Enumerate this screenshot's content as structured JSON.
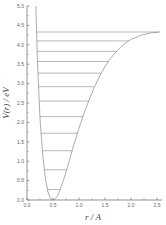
{
  "chart_data": {
    "type": "line",
    "title": "",
    "xlabel": "r / A",
    "ylabel": "V(r) / eV",
    "xlim": [
      0.0,
      2.6
    ],
    "ylim": [
      0.0,
      5.0
    ],
    "grid": false,
    "legend": null,
    "x_ticks": [
      "0.0",
      "0.5",
      "1.0",
      "1.5",
      "2.0",
      "2.5"
    ],
    "y_ticks": [
      "0.0",
      "0.5",
      "1.0",
      "1.5",
      "2.0",
      "2.5",
      "3.0",
      "3.5",
      "4.0",
      "4.5",
      "5.0"
    ],
    "potential_curve": {
      "name": "Morse potential V(r)",
      "description": "Asymmetric potential well with minimum near r = 0.5 A, V = 0; steep repulsive wall at small r, dissociation toward ~4.35 eV at large r",
      "points": [
        {
          "r": 0.17,
          "V": 5.0
        },
        {
          "r": 0.2,
          "V": 3.6
        },
        {
          "r": 0.25,
          "V": 2.1
        },
        {
          "r": 0.3,
          "V": 1.2
        },
        {
          "r": 0.35,
          "V": 0.6
        },
        {
          "r": 0.4,
          "V": 0.22
        },
        {
          "r": 0.45,
          "V": 0.04
        },
        {
          "r": 0.5,
          "V": 0.0
        },
        {
          "r": 0.55,
          "V": 0.04
        },
        {
          "r": 0.6,
          "V": 0.14
        },
        {
          "r": 0.7,
          "V": 0.5
        },
        {
          "r": 0.8,
          "V": 0.95
        },
        {
          "r": 0.9,
          "V": 1.42
        },
        {
          "r": 1.0,
          "V": 1.85
        },
        {
          "r": 1.1,
          "V": 2.25
        },
        {
          "r": 1.2,
          "V": 2.6
        },
        {
          "r": 1.3,
          "V": 2.92
        },
        {
          "r": 1.4,
          "V": 3.2
        },
        {
          "r": 1.5,
          "V": 3.44
        },
        {
          "r": 1.6,
          "V": 3.64
        },
        {
          "r": 1.7,
          "V": 3.8
        },
        {
          "r": 1.8,
          "V": 3.94
        },
        {
          "r": 1.9,
          "V": 4.05
        },
        {
          "r": 2.0,
          "V": 4.14
        },
        {
          "r": 2.2,
          "V": 4.25
        },
        {
          "r": 2.4,
          "V": 4.31
        },
        {
          "r": 2.55,
          "V": 4.33
        }
      ]
    },
    "energy_levels": {
      "name": "Vibrational energy levels",
      "values_eV": [
        0.27,
        0.78,
        1.27,
        1.72,
        2.15,
        2.55,
        2.92,
        3.27,
        3.57,
        3.83,
        4.1,
        4.33
      ]
    },
    "colors": {
      "curve": "#888888",
      "levels": "#888888",
      "axis": "#666666"
    }
  }
}
